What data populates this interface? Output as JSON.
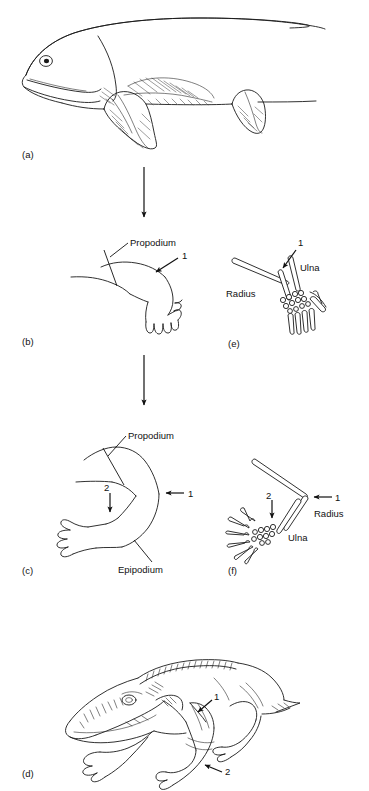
{
  "figure": {
    "background_color": "#ffffff",
    "ink_color": "#1a1a1a",
    "width": 369,
    "height": 791
  },
  "panels": [
    {
      "id": "a",
      "label": "(a)",
      "caption_x": 22,
      "caption_y": 158,
      "subject": "lobe-finned-fish",
      "annotations": []
    },
    {
      "id": "b",
      "label": "(b)",
      "caption_x": 22,
      "caption_y": 345,
      "subject": "fleshy-fin-limb",
      "annotations": [
        {
          "text": "Propodium",
          "x": 130,
          "y": 245,
          "kind": "leader"
        },
        {
          "text": "1",
          "x": 182,
          "y": 267,
          "kind": "arrow"
        }
      ]
    },
    {
      "id": "c",
      "label": "(c)",
      "caption_x": 22,
      "caption_y": 574,
      "subject": "tetrapod-limb",
      "annotations": [
        {
          "text": "Propodium",
          "x": 128,
          "y": 438,
          "kind": "leader"
        },
        {
          "text": "Epipodium",
          "x": 120,
          "y": 570,
          "kind": "leader"
        },
        {
          "text": "1",
          "x": 188,
          "y": 496,
          "kind": "arrow"
        },
        {
          "text": "2",
          "x": 76,
          "y": 509,
          "kind": "arrow"
        }
      ]
    },
    {
      "id": "d",
      "label": "(d)",
      "caption_x": 22,
      "caption_y": 777,
      "subject": "early-tetrapod",
      "annotations": [
        {
          "text": "1",
          "x": 216,
          "y": 702,
          "kind": "arrow"
        },
        {
          "text": "2",
          "x": 224,
          "y": 770,
          "kind": "arrow"
        }
      ]
    },
    {
      "id": "e",
      "label": "(e)",
      "caption_x": 228,
      "caption_y": 347,
      "subject": "fin-skeleton",
      "annotations": [
        {
          "text": "1",
          "x": 299,
          "y": 244,
          "kind": "arrow"
        },
        {
          "text": "Ulna",
          "x": 300,
          "y": 268,
          "kind": "plain"
        },
        {
          "text": "Radius",
          "x": 228,
          "y": 297,
          "kind": "plain"
        }
      ]
    },
    {
      "id": "f",
      "label": "(f)",
      "caption_x": 228,
      "caption_y": 574,
      "subject": "limb-skeleton",
      "annotations": [
        {
          "text": "1",
          "x": 335,
          "y": 500,
          "kind": "arrow"
        },
        {
          "text": "Radius",
          "x": 318,
          "y": 516,
          "kind": "plain"
        },
        {
          "text": "Ulna",
          "x": 290,
          "y": 539,
          "kind": "plain"
        },
        {
          "text": "2",
          "x": 268,
          "y": 498,
          "kind": "arrow"
        }
      ]
    }
  ],
  "flow_arrows": [
    {
      "from_panel": "a",
      "to_panel": "b",
      "x": 144,
      "y_start": 167,
      "y_end": 222
    },
    {
      "from_panel": "b",
      "to_panel": "c",
      "x": 144,
      "y_start": 355,
      "y_end": 410
    }
  ],
  "bone_terms": {
    "propodium": "Propodium",
    "epipodium": "Epipodium",
    "radius": "Radius",
    "ulna": "Ulna"
  },
  "numeric_markers": [
    "1",
    "2"
  ]
}
